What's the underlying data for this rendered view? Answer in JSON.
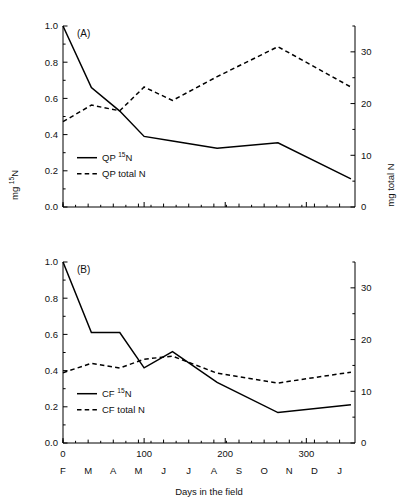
{
  "header": {
    "cropped_running_head": ""
  },
  "axis": {
    "x_label": "Days in the field",
    "y_left_label_pre": "mg ",
    "y_left_label_sup": "15",
    "y_left_label_post": "N",
    "y_right_label": "mg total N",
    "x_ticks": [
      "0",
      "100",
      "200",
      "300"
    ],
    "x_tick_values": [
      0,
      100,
      200,
      300
    ],
    "month_labels": [
      "F",
      "M",
      "A",
      "M",
      "J",
      "J",
      "A",
      "S",
      "O",
      "N",
      "D",
      "J"
    ],
    "month_positions": [
      0,
      31,
      62,
      93,
      124,
      155,
      186,
      217,
      248,
      279,
      310,
      341
    ],
    "y_left_ticks": [
      "0.0",
      "0.2",
      "0.4",
      "0.6",
      "0.8",
      "1.0"
    ],
    "y_left_tick_values": [
      0.0,
      0.2,
      0.4,
      0.6,
      0.8,
      1.0
    ],
    "y_right_ticks": [
      "0",
      "10",
      "20",
      "30"
    ],
    "y_right_tick_values": [
      0,
      10,
      20,
      30
    ],
    "y_right_minor_values": [
      5,
      15,
      25,
      35
    ]
  },
  "panels": {
    "a": {
      "tag": "(A)",
      "legend": [
        {
          "label_pre": "QP ",
          "label_sup": "15",
          "label_post": "N",
          "style": "solid"
        },
        {
          "label_pre": "QP total N",
          "label_sup": "",
          "label_post": "",
          "style": "dashed"
        }
      ]
    },
    "b": {
      "tag": "(B)",
      "legend": [
        {
          "label_pre": "CF ",
          "label_sup": "15",
          "label_post": "N",
          "style": "solid"
        },
        {
          "label_pre": "CF total N",
          "label_sup": "",
          "label_post": "",
          "style": "dashed"
        }
      ]
    }
  },
  "chart_data": [
    {
      "type": "line",
      "panel": "(A)",
      "title": "",
      "xlabel": "Days in the field",
      "ylabel": "mg 15N",
      "ylabel_right": "mg total N",
      "xlim": [
        0,
        360
      ],
      "ylim": [
        0.0,
        1.0
      ],
      "ylim_right": [
        0,
        35
      ],
      "grid": false,
      "legend_position": "lower-left",
      "series": [
        {
          "name": "QP 15N",
          "axis": "left",
          "style": "solid",
          "x": [
            0,
            35,
            70,
            100,
            135,
            190,
            265,
            355
          ],
          "y": [
            1.0,
            0.66,
            0.53,
            0.39,
            0.365,
            0.325,
            0.355,
            0.155
          ]
        },
        {
          "name": "QP total N",
          "axis": "right",
          "style": "dashed",
          "x": [
            0,
            35,
            70,
            100,
            135,
            190,
            265,
            355
          ],
          "y": [
            16.5,
            19.7,
            18.6,
            23.2,
            20.6,
            25.2,
            31.0,
            23.2
          ]
        }
      ]
    },
    {
      "type": "line",
      "panel": "(B)",
      "title": "",
      "xlabel": "Days in the field",
      "ylabel": "mg 15N",
      "ylabel_right": "mg total N",
      "xlim": [
        0,
        360
      ],
      "ylim": [
        0.0,
        1.0
      ],
      "ylim_right": [
        0,
        35
      ],
      "grid": false,
      "legend_position": "lower-left",
      "series": [
        {
          "name": "CF 15N",
          "axis": "left",
          "style": "solid",
          "x": [
            0,
            35,
            70,
            100,
            135,
            190,
            265,
            355
          ],
          "y": [
            1.0,
            0.61,
            0.61,
            0.415,
            0.505,
            0.335,
            0.168,
            0.212
          ]
        },
        {
          "name": "CF total N",
          "axis": "right",
          "style": "dashed",
          "x": [
            0,
            35,
            70,
            100,
            135,
            190,
            265,
            355
          ],
          "y": [
            13.6,
            15.4,
            14.5,
            16.2,
            16.8,
            13.5,
            11.6,
            13.7
          ]
        }
      ]
    }
  ]
}
